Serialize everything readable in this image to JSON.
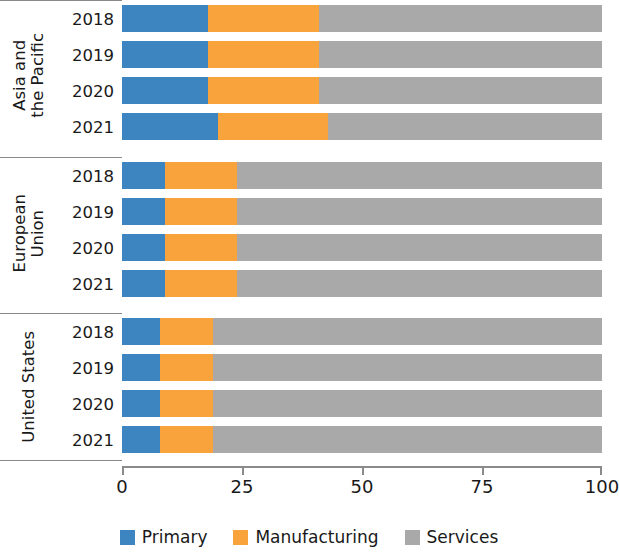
{
  "chart_data": {
    "type": "bar",
    "orientation": "horizontal",
    "stacked": true,
    "stack_mode": "percent",
    "title": "",
    "subtitle": "",
    "xlabel": "",
    "ylabel": "",
    "xlim": [
      0,
      100
    ],
    "xticks": [
      0,
      25,
      50,
      75,
      100
    ],
    "xtick_labels": [
      "0",
      "25",
      "50",
      "75",
      "100"
    ],
    "grid": false,
    "legend_position": "bottom",
    "series": [
      {
        "name": "Primary",
        "color": "#3d85c0",
        "values": [
          18,
          18,
          18,
          20,
          9,
          9,
          9,
          9,
          8,
          8,
          8,
          8
        ]
      },
      {
        "name": "Manufacturing",
        "color": "#f9a33d",
        "values": [
          23,
          23,
          23,
          23,
          15,
          15,
          15,
          15,
          11,
          11,
          11,
          11
        ]
      },
      {
        "name": "Services",
        "color": "#a9a9a9",
        "values": [
          59,
          59,
          59,
          57,
          76,
          76,
          76,
          76,
          81,
          81,
          81,
          81
        ]
      }
    ],
    "groups": [
      {
        "name": "Asia and the Pacific",
        "name_lines": [
          "Asia and",
          "the Pacific"
        ],
        "rows": [
          {
            "year": "2018",
            "primary": 18,
            "manufacturing": 23,
            "services": 59
          },
          {
            "year": "2019",
            "primary": 18,
            "manufacturing": 23,
            "services": 59
          },
          {
            "year": "2020",
            "primary": 18,
            "manufacturing": 23,
            "services": 59
          },
          {
            "year": "2021",
            "primary": 20,
            "manufacturing": 23,
            "services": 57
          }
        ]
      },
      {
        "name": "European Union",
        "name_lines": [
          "European",
          "Union"
        ],
        "rows": [
          {
            "year": "2018",
            "primary": 9,
            "manufacturing": 15,
            "services": 76
          },
          {
            "year": "2019",
            "primary": 9,
            "manufacturing": 15,
            "services": 76
          },
          {
            "year": "2020",
            "primary": 9,
            "manufacturing": 15,
            "services": 76
          },
          {
            "year": "2021",
            "primary": 9,
            "manufacturing": 15,
            "services": 76
          }
        ]
      },
      {
        "name": "United States",
        "name_lines": [
          "United States"
        ],
        "rows": [
          {
            "year": "2018",
            "primary": 8,
            "manufacturing": 11,
            "services": 81
          },
          {
            "year": "2019",
            "primary": 8,
            "manufacturing": 11,
            "services": 81
          },
          {
            "year": "2020",
            "primary": 8,
            "manufacturing": 11,
            "services": 81
          },
          {
            "year": "2021",
            "primary": 8,
            "manufacturing": 11,
            "services": 81
          }
        ]
      }
    ],
    "legend": [
      {
        "label": "Primary",
        "color": "#3d85c0"
      },
      {
        "label": "Manufacturing",
        "color": "#f9a33d"
      },
      {
        "label": "Services",
        "color": "#a9a9a9"
      }
    ]
  },
  "colors": {
    "primary": "#3d85c0",
    "manufacturing": "#f9a33d",
    "services": "#a9a9a9",
    "axis": "#8a8a8a",
    "text": "#191919",
    "background": "#ffffff"
  }
}
